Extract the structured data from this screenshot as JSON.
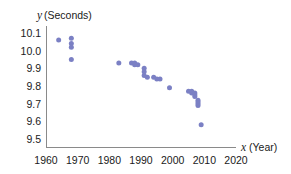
{
  "chart_data": {
    "type": "scatter",
    "title": "",
    "xlabel": "x (Year)",
    "ylabel": "y (Seconds)",
    "xlabel_var": "x",
    "xlabel_unit": "(Year)",
    "ylabel_var": "y",
    "ylabel_unit": "(Seconds)",
    "xlim": [
      1960,
      2020
    ],
    "ylim": [
      9.5,
      10.1
    ],
    "xticks": [
      1960,
      1970,
      1980,
      1990,
      2000,
      2010,
      2020
    ],
    "yticks": [
      10.1,
      10.0,
      9.9,
      9.8,
      9.7,
      9.6,
      9.5
    ],
    "xtick_labels": [
      "1960",
      "1970",
      "1980",
      "1990",
      "2000",
      "2010",
      "2020"
    ],
    "ytick_labels": [
      "10.1",
      "10.0",
      "9.9",
      "9.8",
      "9.7",
      "9.6",
      "9.5"
    ],
    "grid": false,
    "legend": false,
    "marker_color": "#7b80c4",
    "marker_size": 5,
    "axis_color": "#8a8a8a",
    "series": [
      {
        "name": "100 m record time",
        "points": [
          {
            "x": 1964,
            "y": 10.06
          },
          {
            "x": 1968,
            "y": 10.07
          },
          {
            "x": 1968,
            "y": 10.04
          },
          {
            "x": 1968,
            "y": 10.02
          },
          {
            "x": 1968,
            "y": 9.95
          },
          {
            "x": 1983,
            "y": 9.93
          },
          {
            "x": 1987,
            "y": 9.93
          },
          {
            "x": 1988,
            "y": 9.92
          },
          {
            "x": 1988,
            "y": 9.93
          },
          {
            "x": 1989,
            "y": 9.92
          },
          {
            "x": 1991,
            "y": 9.9
          },
          {
            "x": 1991,
            "y": 9.86
          },
          {
            "x": 1991,
            "y": 9.88
          },
          {
            "x": 1992,
            "y": 9.85
          },
          {
            "x": 1994,
            "y": 9.85
          },
          {
            "x": 1995,
            "y": 9.84
          },
          {
            "x": 1996,
            "y": 9.84
          },
          {
            "x": 1999,
            "y": 9.79
          },
          {
            "x": 2005,
            "y": 9.77
          },
          {
            "x": 2006,
            "y": 9.77
          },
          {
            "x": 2006,
            "y": 9.76
          },
          {
            "x": 2007,
            "y": 9.76
          },
          {
            "x": 2007,
            "y": 9.75
          },
          {
            "x": 2007,
            "y": 9.74
          },
          {
            "x": 2008,
            "y": 9.72
          },
          {
            "x": 2008,
            "y": 9.71
          },
          {
            "x": 2008,
            "y": 9.7
          },
          {
            "x": 2008,
            "y": 9.69
          },
          {
            "x": 2009,
            "y": 9.58
          }
        ]
      }
    ]
  }
}
